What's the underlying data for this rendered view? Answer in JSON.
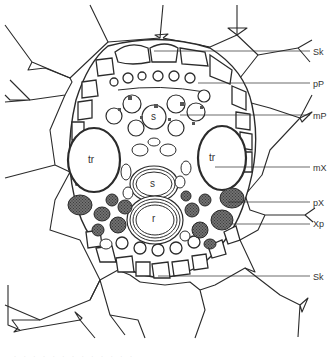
{
  "figure": {
    "type": "botanical cross-section drawing",
    "stroke_color": "#2b2b2b",
    "background": "#ffffff"
  },
  "labels": [
    {
      "id": "Sk-top",
      "text": "Sk",
      "x": 313,
      "y": 47
    },
    {
      "id": "pP",
      "text": "pP",
      "x": 313,
      "y": 79
    },
    {
      "id": "mP",
      "text": "mP",
      "x": 313,
      "y": 111
    },
    {
      "id": "mX",
      "text": "mX",
      "x": 313,
      "y": 163
    },
    {
      "id": "pX",
      "text": "pX",
      "x": 313,
      "y": 198
    },
    {
      "id": "Xp",
      "text": "Xp",
      "x": 313,
      "y": 219
    },
    {
      "id": "Sk-bottom",
      "text": "Sk",
      "x": 313,
      "y": 272
    }
  ],
  "inner_labels": [
    {
      "id": "s-top",
      "text": "s",
      "x": 154,
      "y": 117
    },
    {
      "id": "tr-left",
      "text": "tr",
      "x": 93,
      "y": 160
    },
    {
      "id": "tr-right",
      "text": "tr",
      "x": 214,
      "y": 158
    },
    {
      "id": "s-mid",
      "text": "s",
      "x": 152,
      "y": 183
    },
    {
      "id": "r",
      "text": "r",
      "x": 154,
      "y": 216
    }
  ],
  "caption": "· · ·  · ·  · ·  ·  · ·  ·  · ·"
}
